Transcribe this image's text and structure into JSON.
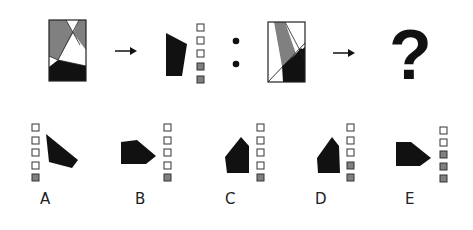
{
  "puzzle": {
    "colors": {
      "black": "#111111",
      "gray": "#808080",
      "white": "#ffffff",
      "stroke": "#222222"
    },
    "question_mark": "?",
    "analogy_separator": ":",
    "arrow": "→",
    "example": {
      "source_panel": "rectangle with gray, white and black regions",
      "result_shape": "black quadrilateral",
      "result_indicator": [
        "empty",
        "empty",
        "empty",
        "gray",
        "gray"
      ]
    },
    "query": {
      "source_panel": "rectangle with gray, white and black regions and diagonal line"
    },
    "options": [
      {
        "label": "A",
        "indicator": [
          "empty",
          "empty",
          "empty",
          "empty",
          "gray"
        ],
        "indicator_side": "left"
      },
      {
        "label": "B",
        "indicator": [
          "empty",
          "empty",
          "empty",
          "empty",
          "gray"
        ],
        "indicator_side": "right"
      },
      {
        "label": "C",
        "indicator": [
          "empty",
          "empty",
          "empty",
          "empty",
          "gray"
        ],
        "indicator_side": "right"
      },
      {
        "label": "D",
        "indicator": [
          "empty",
          "empty",
          "empty",
          "gray",
          "gray"
        ],
        "indicator_side": "right"
      },
      {
        "label": "E",
        "indicator": [
          "empty",
          "empty",
          "gray",
          "gray",
          "gray"
        ],
        "indicator_side": "right"
      }
    ]
  }
}
